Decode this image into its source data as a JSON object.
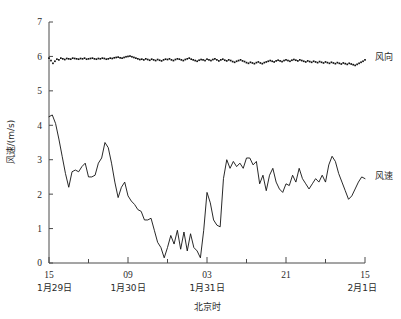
{
  "chart_data": {
    "type": "line",
    "title": "",
    "xlabel": "北京时",
    "ylabel": "风速/(m/s)",
    "ylim": [
      0,
      7
    ],
    "yticks": [
      0,
      1,
      2,
      3,
      4,
      5,
      6,
      7
    ],
    "xlim": [
      0,
      48
    ],
    "xtick_positions": [
      0,
      12,
      24,
      36,
      48
    ],
    "xtick_labels": [
      "15",
      "09",
      "03",
      "21",
      "15"
    ],
    "xtick_minor_step": 6,
    "date_labels": [
      {
        "x": 0,
        "text": "1月29日"
      },
      {
        "x": 12,
        "text": "1月30日"
      },
      {
        "x": 24,
        "text": "1月31日"
      },
      {
        "x": 48,
        "text": "2月1日"
      }
    ],
    "grid": false,
    "legend_position": "right-inline",
    "series": [
      {
        "name": "风向",
        "label": "风向",
        "style": "dotted-scatter",
        "color": "#111111",
        "label_x": 49.5,
        "label_y": 6.0,
        "x": [
          0,
          0.3,
          0.6,
          0.9,
          1.2,
          1.5,
          1.8,
          2.1,
          2.4,
          2.7,
          3.0,
          3.3,
          3.6,
          3.9,
          4.2,
          4.5,
          4.8,
          5.1,
          5.4,
          5.7,
          6.0,
          6.3,
          6.6,
          6.9,
          7.2,
          7.5,
          7.8,
          8.1,
          8.4,
          8.7,
          9.0,
          9.3,
          9.6,
          9.9,
          10.2,
          10.5,
          10.8,
          11.1,
          11.4,
          11.7,
          12.0,
          12.3,
          12.6,
          12.9,
          13.2,
          13.5,
          13.8,
          14.1,
          14.4,
          14.7,
          15.0,
          15.3,
          15.6,
          15.9,
          16.2,
          16.5,
          16.8,
          17.1,
          17.4,
          17.7,
          18.0,
          18.3,
          18.6,
          18.9,
          19.2,
          19.5,
          19.8,
          20.1,
          20.4,
          20.7,
          21.0,
          21.3,
          21.6,
          21.9,
          22.2,
          22.5,
          22.8,
          23.1,
          23.4,
          23.7,
          24.0,
          24.3,
          24.6,
          24.9,
          25.2,
          25.5,
          25.8,
          26.1,
          26.4,
          26.7,
          27.0,
          27.3,
          27.6,
          27.9,
          28.2,
          28.5,
          28.8,
          29.1,
          29.4,
          29.7,
          30.0,
          30.3,
          30.6,
          30.9,
          31.2,
          31.5,
          31.8,
          32.1,
          32.4,
          32.7,
          33.0,
          33.3,
          33.6,
          33.9,
          34.2,
          34.5,
          34.8,
          35.1,
          35.4,
          35.7,
          36.0,
          36.3,
          36.6,
          36.9,
          37.2,
          37.5,
          37.8,
          38.1,
          38.4,
          38.7,
          39.0,
          39.3,
          39.6,
          39.9,
          40.2,
          40.5,
          40.8,
          41.1,
          41.4,
          41.7,
          42.0,
          42.3,
          42.6,
          42.9,
          43.2,
          43.5,
          43.8,
          44.1,
          44.4,
          44.7,
          45.0,
          45.3,
          45.6,
          45.9,
          46.2,
          46.5,
          46.8,
          47.1,
          47.4,
          47.7,
          48.0
        ],
        "y": [
          5.95,
          5.88,
          5.8,
          5.86,
          5.92,
          5.9,
          5.95,
          5.93,
          5.91,
          5.94,
          5.93,
          5.92,
          5.95,
          5.94,
          5.93,
          5.92,
          5.94,
          5.93,
          5.95,
          5.92,
          5.93,
          5.94,
          5.95,
          5.93,
          5.92,
          5.94,
          5.93,
          5.95,
          5.94,
          5.92,
          5.93,
          5.95,
          5.94,
          5.96,
          5.97,
          5.98,
          5.96,
          5.95,
          5.97,
          5.99,
          6.0,
          6.01,
          5.99,
          5.97,
          5.95,
          5.93,
          5.91,
          5.92,
          5.9,
          5.93,
          5.91,
          5.89,
          5.92,
          5.9,
          5.88,
          5.91,
          5.89,
          5.87,
          5.9,
          5.92,
          5.91,
          5.93,
          5.9,
          5.88,
          5.91,
          5.93,
          5.92,
          5.9,
          5.88,
          5.91,
          5.93,
          5.95,
          5.92,
          5.9,
          5.88,
          5.86,
          5.89,
          5.91,
          5.9,
          5.88,
          5.92,
          5.9,
          5.88,
          5.91,
          5.93,
          5.9,
          5.87,
          5.9,
          5.92,
          5.89,
          5.87,
          5.9,
          5.88,
          5.85,
          5.83,
          5.86,
          5.88,
          5.9,
          5.87,
          5.85,
          5.82,
          5.8,
          5.83,
          5.81,
          5.79,
          5.82,
          5.84,
          5.81,
          5.79,
          5.82,
          5.84,
          5.86,
          5.88,
          5.86,
          5.84,
          5.87,
          5.89,
          5.87,
          5.85,
          5.88,
          5.9,
          5.88,
          5.86,
          5.89,
          5.91,
          5.89,
          5.87,
          5.9,
          5.88,
          5.86,
          5.84,
          5.87,
          5.85,
          5.83,
          5.86,
          5.84,
          5.82,
          5.85,
          5.83,
          5.81,
          5.84,
          5.82,
          5.8,
          5.83,
          5.81,
          5.79,
          5.82,
          5.8,
          5.78,
          5.81,
          5.79,
          5.77,
          5.8,
          5.78,
          5.76,
          5.74,
          5.77,
          5.8,
          5.83,
          5.86,
          5.9
        ]
      },
      {
        "name": "风速",
        "label": "风速",
        "style": "solid-line",
        "color": "#111111",
        "label_x": 49.5,
        "label_y": 2.55,
        "x": [
          0.0,
          0.5,
          1.0,
          1.5,
          2.0,
          2.5,
          3.0,
          3.5,
          4.0,
          4.5,
          5.0,
          5.5,
          6.0,
          6.5,
          7.0,
          7.5,
          8.0,
          8.5,
          9.0,
          9.5,
          10.0,
          10.5,
          11.0,
          11.5,
          12.0,
          12.5,
          13.0,
          13.5,
          14.0,
          14.5,
          15.0,
          15.5,
          16.0,
          16.5,
          17.0,
          17.5,
          18.0,
          18.5,
          19.0,
          19.5,
          20.0,
          20.5,
          21.0,
          21.5,
          22.0,
          22.5,
          23.0,
          23.5,
          24.0,
          24.5,
          25.0,
          25.5,
          26.0,
          26.5,
          27.0,
          27.5,
          28.0,
          28.5,
          29.0,
          29.5,
          30.0,
          30.5,
          31.0,
          31.5,
          32.0,
          32.5,
          33.0,
          33.5,
          34.0,
          34.5,
          35.0,
          35.5,
          36.0,
          36.5,
          37.0,
          37.5,
          38.0,
          38.5,
          39.0,
          39.5,
          40.0,
          40.5,
          41.0,
          41.5,
          42.0,
          42.5,
          43.0,
          43.5,
          44.0,
          44.5,
          45.0,
          45.5,
          46.0,
          46.5,
          47.0,
          47.5,
          48.0
        ],
        "y": [
          4.25,
          4.3,
          4.05,
          3.6,
          3.1,
          2.6,
          2.2,
          2.65,
          2.7,
          2.65,
          2.8,
          2.9,
          2.5,
          2.5,
          2.55,
          2.9,
          3.05,
          3.5,
          3.35,
          2.9,
          2.35,
          1.9,
          2.2,
          2.35,
          1.95,
          1.8,
          1.7,
          1.55,
          1.5,
          1.25,
          1.25,
          1.3,
          0.95,
          0.6,
          0.45,
          0.15,
          0.45,
          0.8,
          0.55,
          0.95,
          0.4,
          0.9,
          0.35,
          0.85,
          0.45,
          0.35,
          0.15,
          0.95,
          2.05,
          1.75,
          1.25,
          1.1,
          1.05,
          2.45,
          3.0,
          2.75,
          2.95,
          2.8,
          2.9,
          2.75,
          3.05,
          3.05,
          2.85,
          2.95,
          2.3,
          2.55,
          2.1,
          2.55,
          2.75,
          2.35,
          2.15,
          2.05,
          2.3,
          2.25,
          2.55,
          2.35,
          2.75,
          2.45,
          2.3,
          2.15,
          2.3,
          2.45,
          2.35,
          2.55,
          2.35,
          2.85,
          3.1,
          2.95,
          2.6,
          2.35,
          2.1,
          1.85,
          1.95,
          2.15,
          2.35,
          2.5,
          2.45
        ]
      }
    ]
  },
  "axes": {
    "y_axis_name": "wind-speed-axis",
    "x_axis_name": "time-axis"
  }
}
